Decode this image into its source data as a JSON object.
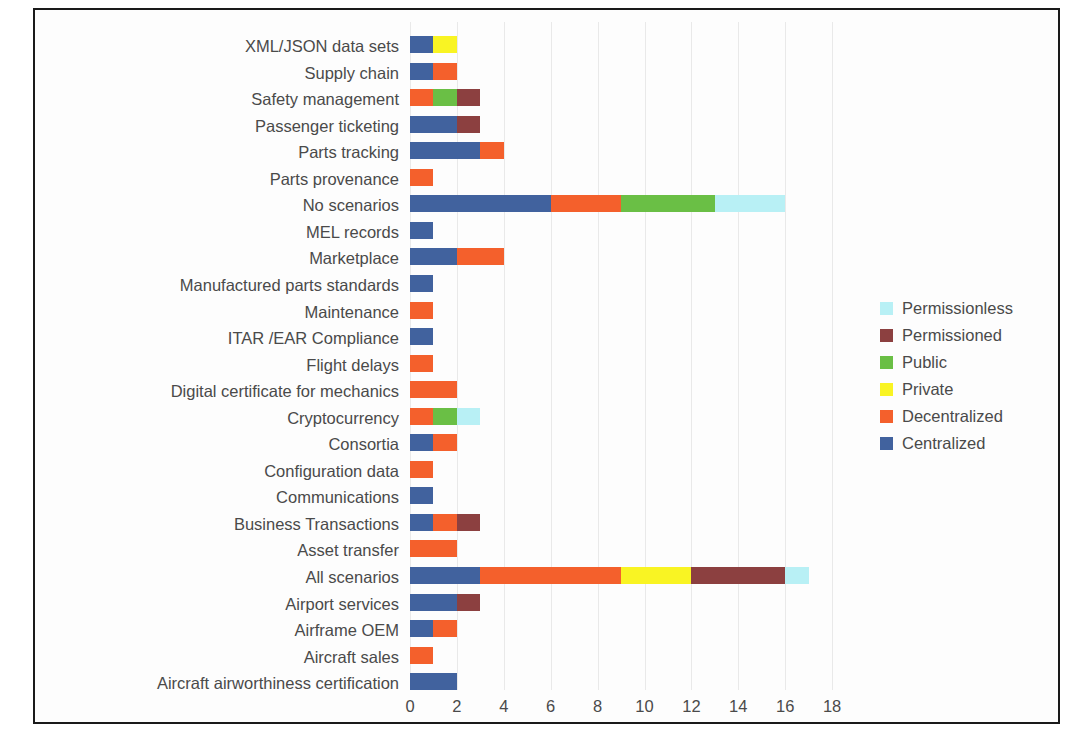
{
  "figure": {
    "copyright": "© SAE International"
  },
  "legend": {
    "position": "right",
    "items": [
      {
        "label": "Permissionless",
        "color": "#b8f0f5"
      },
      {
        "label": "Permissioned",
        "color": "#8c4040"
      },
      {
        "label": "Public",
        "color": "#6abf45"
      },
      {
        "label": "Private",
        "color": "#f9f423"
      },
      {
        "label": "Decentralized",
        "color": "#f4602c"
      },
      {
        "label": "Centralized",
        "color": "#41629e"
      }
    ]
  },
  "chart_data": {
    "type": "bar",
    "orientation": "horizontal",
    "stacked": true,
    "title": "",
    "xlabel": "",
    "ylabel": "",
    "xlim": [
      0,
      18
    ],
    "xticks": [
      0,
      2,
      4,
      6,
      8,
      10,
      12,
      14,
      16,
      18
    ],
    "grid": "vertical",
    "legend_position": "right",
    "categories": [
      "XML/JSON data sets",
      "Supply chain",
      "Safety management",
      "Passenger ticketing",
      "Parts tracking",
      "Parts provenance",
      "No scenarios",
      "MEL records",
      "Marketplace",
      "Manufactured parts standards",
      "Maintenance",
      "ITAR /EAR Compliance",
      "Flight delays",
      "Digital certificate for mechanics",
      "Cryptocurrency",
      "Consortia",
      "Configuration data",
      "Communications",
      "Business Transactions",
      "Asset transfer",
      "All scenarios",
      "Airport services",
      "Airframe OEM",
      "Aircraft sales",
      "Aircraft airworthiness certification"
    ],
    "series": [
      {
        "name": "Centralized",
        "color": "#41629e",
        "values": [
          1,
          1,
          0,
          2,
          3,
          0,
          6,
          1,
          2,
          1,
          0,
          1,
          0,
          0,
          0,
          1,
          0,
          1,
          1,
          0,
          3,
          2,
          1,
          0,
          2
        ]
      },
      {
        "name": "Decentralized",
        "color": "#f4602c",
        "values": [
          0,
          1,
          1,
          0,
          1,
          1,
          3,
          0,
          2,
          0,
          1,
          0,
          1,
          2,
          1,
          1,
          1,
          0,
          1,
          2,
          6,
          0,
          1,
          1,
          0
        ]
      },
      {
        "name": "Private",
        "color": "#f9f423",
        "values": [
          1,
          0,
          0,
          0,
          0,
          0,
          0,
          0,
          0,
          0,
          0,
          0,
          0,
          0,
          0,
          0,
          0,
          0,
          0,
          0,
          3,
          0,
          0,
          0,
          0
        ]
      },
      {
        "name": "Public",
        "color": "#6abf45",
        "values": [
          0,
          0,
          1,
          0,
          0,
          0,
          4,
          0,
          0,
          0,
          0,
          0,
          0,
          0,
          1,
          0,
          0,
          0,
          0,
          0,
          0,
          0,
          0,
          0,
          0
        ]
      },
      {
        "name": "Permissioned",
        "color": "#8c4040",
        "values": [
          0,
          0,
          1,
          1,
          0,
          0,
          0,
          0,
          0,
          0,
          0,
          0,
          0,
          0,
          0,
          0,
          0,
          0,
          1,
          0,
          4,
          1,
          0,
          0,
          0
        ]
      },
      {
        "name": "Permissionless",
        "color": "#b8f0f5",
        "values": [
          0,
          0,
          0,
          0,
          0,
          0,
          3,
          0,
          0,
          0,
          0,
          0,
          0,
          0,
          1,
          0,
          0,
          0,
          0,
          0,
          1,
          0,
          0,
          0,
          0
        ]
      }
    ],
    "totals": [
      2,
      2,
      3,
      3,
      4,
      1,
      16,
      1,
      4,
      1,
      1,
      1,
      1,
      2,
      3,
      2,
      1,
      1,
      3,
      2,
      17,
      3,
      2,
      1,
      2
    ]
  }
}
